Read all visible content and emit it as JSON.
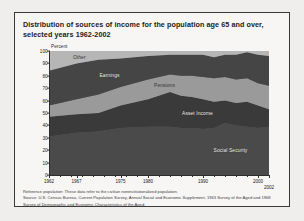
{
  "figure": {
    "title": "Distribution of sources of income for the population age 65 and over, selected years 1962-2002",
    "axis_unit_label": "Percent",
    "footnotes": [
      "Reference population: These data refer to the civilian noninstitutionalized population.",
      "Source: U.S. Census Bureau, Current Population Survey, Annual Social and Economic Supplement; 1963 Survey of the Aged and 1968",
      "Survey of Demographic and Economic Characteristics of the Aged."
    ]
  },
  "colors": {
    "page_background": "#f0eeec",
    "figure_background": "#f7f6f4",
    "frame": "#3a3a3a",
    "social_security": "#4a4a4a",
    "asset_income": "#3a3a3a",
    "pensions": "#9a9a9a",
    "earnings": "#454545",
    "other": "#b6b6b6",
    "text": "#1b1b1b"
  },
  "chart_data": {
    "type": "area",
    "title": "Distribution of sources of income for the population age 65 and over, selected years 1962-2002",
    "xlabel": "",
    "ylabel": "Percent",
    "ylim": [
      0,
      100
    ],
    "xlim": [
      1962,
      2002
    ],
    "grid": false,
    "legend": "in-plot labels",
    "stacked": true,
    "y_ticks": [
      0,
      10,
      20,
      30,
      40,
      50,
      60,
      70,
      80,
      90,
      100
    ],
    "x_ticks": [
      1962,
      1967,
      1975,
      1980,
      1990,
      2000,
      2002
    ],
    "x": [
      1962,
      1967,
      1971,
      1975,
      1980,
      1984,
      1986,
      1988,
      1990,
      1992,
      1994,
      1996,
      1998,
      2000,
      2002
    ],
    "series": [
      {
        "name": "Social Security",
        "values": [
          31,
          34,
          35,
          38,
          39,
          39,
          38,
          38,
          37,
          38,
          42,
          40,
          39,
          38,
          39
        ]
      },
      {
        "name": "Asset Income",
        "values": [
          16,
          15,
          15,
          18,
          22,
          28,
          26,
          25,
          24,
          21,
          18,
          18,
          20,
          18,
          14
        ]
      },
      {
        "name": "Pensions",
        "values": [
          9,
          12,
          15,
          15,
          16,
          14,
          16,
          17,
          18,
          19,
          19,
          19,
          19,
          18,
          19
        ]
      },
      {
        "name": "Earnings",
        "values": [
          28,
          29,
          28,
          23,
          19,
          16,
          17,
          17,
          18,
          17,
          18,
          20,
          21,
          23,
          24
        ]
      },
      {
        "name": "Other",
        "values": [
          16,
          10,
          7,
          6,
          4,
          3,
          3,
          3,
          3,
          5,
          3,
          3,
          1,
          3,
          4
        ]
      }
    ]
  }
}
